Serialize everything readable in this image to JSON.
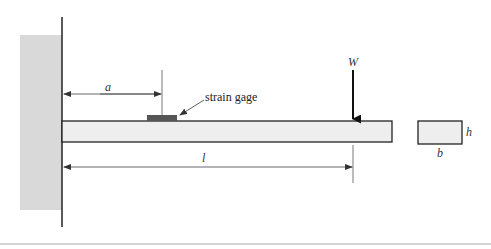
{
  "diagram": {
    "labels": {
      "a": "a",
      "strain_gage": "strain gage",
      "W": "W",
      "l": "l",
      "h": "h",
      "b": "b"
    },
    "colors": {
      "wall_fill": "#d9d9d9",
      "beam_fill": "#eeeeee",
      "gage_fill": "#555555",
      "line": "#222222",
      "dim_line": "#444444",
      "bottom_rule": "#aaaaaa"
    }
  }
}
